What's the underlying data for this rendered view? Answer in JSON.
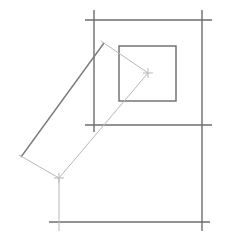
{
  "diagram": {
    "title": "",
    "colors": {
      "background": "#ffffff",
      "frame_line": "#6e6e6e",
      "inner_box": "#6a6a6a",
      "rotated_long_edge": "#7a7a7a",
      "construction_line": "#b8b8b8"
    },
    "frame_lines": {
      "top": {
        "x1": 85,
        "y1": 20,
        "x2": 212,
        "y2": 20
      },
      "middle": {
        "x1": 85,
        "y1": 125,
        "x2": 212,
        "y2": 125
      },
      "bottom": {
        "x1": 49,
        "y1": 222,
        "x2": 210,
        "y2": 222
      },
      "left_vertical": {
        "x1": 94,
        "y1": 10,
        "x2": 94,
        "y2": 132
      },
      "right_vertical": {
        "x1": 202,
        "y1": 10,
        "x2": 202,
        "y2": 231
      }
    },
    "inner_box": {
      "x": 119,
      "y": 46,
      "width": 57,
      "height": 55
    },
    "rotated_rectangle": {
      "top_corner": [
        104,
        43
      ],
      "right_corner": [
        148,
        73
      ],
      "bottom_corner": [
        59,
        178
      ],
      "left_corner": [
        21,
        157
      ]
    },
    "crosshairs": [
      {
        "x": 148,
        "y": 73,
        "size": 5
      },
      {
        "x": 59,
        "y": 178,
        "size": 5
      }
    ],
    "drop_line": {
      "x1": 59,
      "y1": 178,
      "x2": 59,
      "y2": 231
    }
  }
}
